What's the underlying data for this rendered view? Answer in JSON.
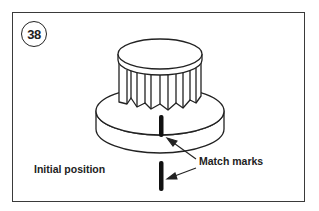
{
  "figure": {
    "step_number": "38",
    "labels": {
      "initial_position": "Initial position",
      "match_marks": "Match marks"
    },
    "colors": {
      "line": "#222222",
      "frame": "#3a3a3a",
      "background": "#ffffff"
    },
    "elements": [
      "knob with serrated skirt",
      "base disc",
      "upper match mark",
      "lower match mark",
      "two leader arrows"
    ]
  }
}
